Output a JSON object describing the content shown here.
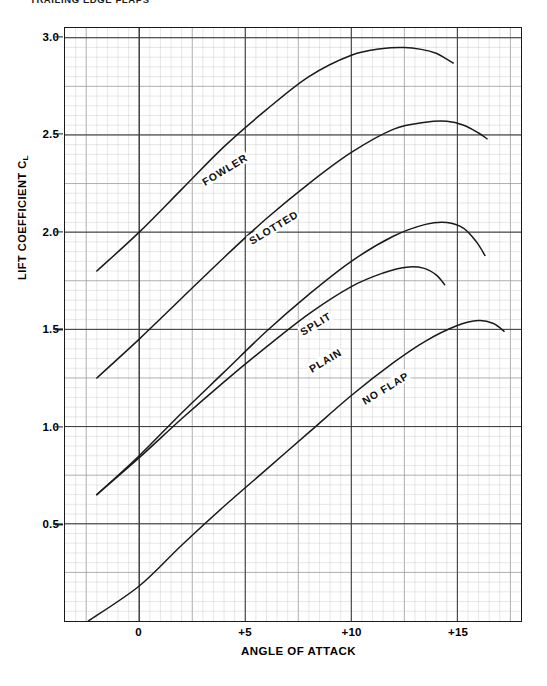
{
  "page": {
    "title": "TRAILING EDGE FLAPS"
  },
  "chart_data": {
    "type": "line",
    "title": "TRAILING EDGE FLAPS",
    "xlabel": "ANGLE OF ATTACK",
    "ylabel": "LIFT COEFFICIENT CL",
    "ylabel_main": "LIFT COEFFICIENT C",
    "ylabel_sub": "L",
    "xlim": [
      -3.5,
      18.0
    ],
    "ylim": [
      0.0,
      3.05
    ],
    "grid": true,
    "minor_grid": true,
    "legend": "inline-curve-labels",
    "x_ticks": [
      {
        "value": 0,
        "label": "0"
      },
      {
        "value": 5,
        "label": "+5"
      },
      {
        "value": 10,
        "label": "+10"
      },
      {
        "value": 15,
        "label": "+15"
      }
    ],
    "y_ticks": [
      {
        "value": 3.0,
        "label": "3.0"
      },
      {
        "value": 2.5,
        "label": "2.5"
      },
      {
        "value": 2.0,
        "label": "2.0"
      },
      {
        "value": 1.5,
        "label": "1.5"
      },
      {
        "value": 1.0,
        "label": "1.0"
      },
      {
        "value": 0.5,
        "label": "0.5"
      }
    ],
    "series": [
      {
        "name": "FOWLER",
        "label": "FOWLER",
        "label_angle": -31,
        "label_x": 3.0,
        "label_y": 2.25,
        "color": "#1a1a1a",
        "x": [
          -2.0,
          0.0,
          2.0,
          4.0,
          6.0,
          8.0,
          10.0,
          11.5,
          12.5,
          13.3,
          14.0,
          14.5,
          14.8
        ],
        "y": [
          1.8,
          2.0,
          2.22,
          2.44,
          2.63,
          2.8,
          2.91,
          2.945,
          2.95,
          2.94,
          2.92,
          2.89,
          2.87
        ]
      },
      {
        "name": "SLOTTED",
        "label": "SLOTTED",
        "label_angle": -31,
        "label_x": 5.2,
        "label_y": 1.95,
        "color": "#1a1a1a",
        "x": [
          -2.0,
          0.0,
          2.0,
          4.0,
          6.0,
          8.0,
          10.0,
          12.0,
          13.5,
          14.5,
          15.3,
          16.0,
          16.4
        ],
        "y": [
          1.25,
          1.45,
          1.66,
          1.87,
          2.07,
          2.25,
          2.41,
          2.53,
          2.565,
          2.57,
          2.55,
          2.51,
          2.48
        ]
      },
      {
        "name": "SPLIT",
        "label": "SPLIT",
        "label_angle": -31,
        "label_x": 7.6,
        "label_y": 1.48,
        "color": "#1a1a1a",
        "x": [
          -2.0,
          0.0,
          2.0,
          4.0,
          6.0,
          8.0,
          10.0,
          12.0,
          13.5,
          14.5,
          15.3,
          15.9,
          16.3
        ],
        "y": [
          0.65,
          0.85,
          1.07,
          1.28,
          1.49,
          1.68,
          1.85,
          1.98,
          2.04,
          2.05,
          2.02,
          1.95,
          1.88
        ]
      },
      {
        "name": "PLAIN",
        "label": "PLAIN",
        "label_angle": -31,
        "label_x": 8.0,
        "label_y": 1.29,
        "color": "#1a1a1a",
        "x": [
          -2.0,
          0.0,
          2.0,
          4.0,
          6.0,
          8.0,
          10.0,
          11.5,
          12.6,
          13.4,
          14.0,
          14.4
        ],
        "y": [
          0.65,
          0.84,
          1.04,
          1.23,
          1.41,
          1.58,
          1.72,
          1.79,
          1.82,
          1.815,
          1.78,
          1.73
        ]
      },
      {
        "name": "NO FLAP",
        "label": "NO FLAP",
        "label_angle": -31,
        "label_x": 10.5,
        "label_y": 1.13,
        "color": "#1a1a1a",
        "x": [
          -2.4,
          0.0,
          2.0,
          4.0,
          6.0,
          8.0,
          10.0,
          12.0,
          13.5,
          15.0,
          16.0,
          16.7,
          17.2
        ],
        "y": [
          0.0,
          0.18,
          0.39,
          0.59,
          0.78,
          0.97,
          1.16,
          1.33,
          1.44,
          1.52,
          1.545,
          1.53,
          1.49
        ]
      }
    ]
  }
}
